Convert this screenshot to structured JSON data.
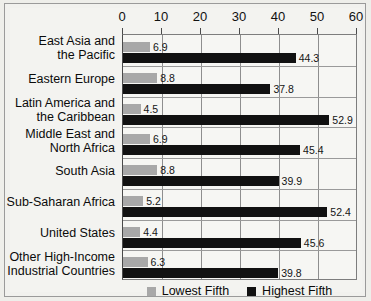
{
  "chart_data": {
    "type": "bar",
    "orientation": "horizontal",
    "title": "",
    "subtitle": "",
    "xlabel": "",
    "ylabel": "",
    "xlim": [
      0,
      60
    ],
    "xticks": [
      0,
      10,
      20,
      30,
      40,
      50,
      60
    ],
    "xtick_labels": [
      "0",
      "10",
      "20",
      "30",
      "40",
      "50",
      "60"
    ],
    "grid": true,
    "grid_axis": "x",
    "legend_position": "bottom",
    "categories": [
      "East Asia and the Pacific",
      "Eastern Europe",
      "Latin America and the Caribbean",
      "Middle East and North Africa",
      "South Asia",
      "Sub-Saharan Africa",
      "United States",
      "Other High-Income Industrial Countries"
    ],
    "category_lines": [
      [
        "East Asia and",
        "the Pacific"
      ],
      [
        "Eastern Europe"
      ],
      [
        "Latin America and",
        "the Caribbean"
      ],
      [
        "Middle East and",
        "North Africa"
      ],
      [
        "South Asia"
      ],
      [
        "Sub-Saharan Africa"
      ],
      [
        "United States"
      ],
      [
        "Other High-Income",
        "Industrial Countries"
      ]
    ],
    "series": [
      {
        "name": "Lowest Fifth",
        "color": "#a8a8a8",
        "values": [
          6.9,
          8.8,
          4.5,
          6.9,
          8.8,
          5.2,
          4.4,
          6.3
        ],
        "labels": [
          "6.9",
          "8.8",
          "4.5",
          "6.9",
          "8.8",
          "5.2",
          "4.4",
          "6.3"
        ]
      },
      {
        "name": "Highest Fifth",
        "color": "#111111",
        "values": [
          44.3,
          37.8,
          52.9,
          45.4,
          39.9,
          52.4,
          45.6,
          39.8
        ],
        "labels": [
          "44.3",
          "37.8",
          "52.9",
          "45.4",
          "39.9",
          "52.4",
          "45.6",
          "39.8"
        ]
      }
    ]
  },
  "legend": {
    "items": [
      {
        "label": "Lowest Fifth",
        "color": "#a8a8a8"
      },
      {
        "label": "Highest Fifth",
        "color": "#111111"
      }
    ]
  },
  "colors": {
    "lowest_fifth": "#a8a8a8",
    "highest_fifth": "#111111",
    "plot_background": "#f6f6f3",
    "page_background": "#eeeeea",
    "gridline": "#8e8e8e",
    "axis": "#4a4a4a"
  }
}
